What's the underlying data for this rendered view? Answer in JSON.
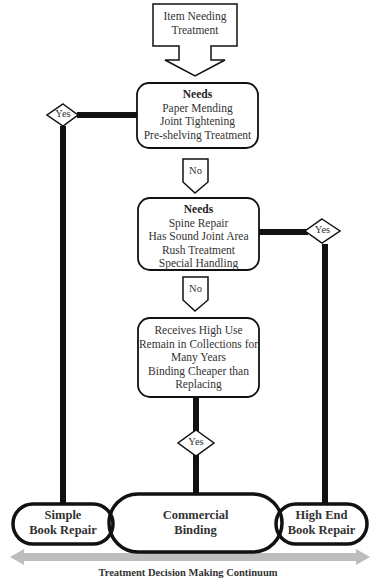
{
  "diagram": {
    "start": {
      "lines": [
        "Item Needing",
        "Treatment"
      ]
    },
    "decision1": {
      "heading": "Needs",
      "lines": [
        "Paper Mending",
        "Joint Tightening",
        "Pre-shelving Treatment"
      ],
      "yes_label": "Yes",
      "no_label": "No"
    },
    "decision2": {
      "heading": "Needs",
      "lines": [
        "Spine Repair",
        "Has Sound Joint Area",
        "Rush Treatment",
        "Special Handling"
      ],
      "yes_label": "Yes",
      "no_label": "No"
    },
    "decision3": {
      "lines": [
        "Receives High Use",
        "Remain in Collections for",
        "Many Years",
        "Binding Cheaper than",
        "Replacing"
      ],
      "yes_label": "Yes"
    },
    "outcomes": {
      "left": {
        "lines": [
          "Simple",
          "Book Repair"
        ]
      },
      "center": {
        "lines": [
          "Commercial",
          "Binding"
        ]
      },
      "right": {
        "lines": [
          "High End",
          "Book Repair"
        ]
      }
    },
    "continuum": {
      "caption": "Treatment Decision Making Continuum",
      "color": "#b8b8b8"
    },
    "colors": {
      "stroke": "#111111",
      "text": "#333333",
      "background": "#ffffff"
    }
  }
}
